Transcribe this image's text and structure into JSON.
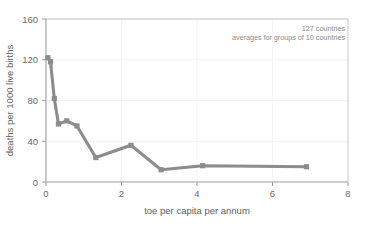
{
  "chart_data": {
    "type": "line",
    "title": "",
    "xlabel": "toe per capita per annum",
    "ylabel": "deaths per 1000 live births",
    "xlim": [
      0,
      8
    ],
    "ylim": [
      0,
      160
    ],
    "xticks": [
      0,
      2,
      4,
      6,
      8
    ],
    "yticks": [
      0,
      40,
      80,
      120,
      160
    ],
    "xtick_labels": [
      "0",
      "2",
      "4",
      "6",
      "8"
    ],
    "ytick_labels": [
      "0",
      "40",
      "80",
      "120",
      "160"
    ],
    "grid": true,
    "legend": "none",
    "series": [
      {
        "name": "infant mortality vs energy use",
        "color": "#8c8c8c",
        "marker": "square",
        "x": [
          0.05,
          0.12,
          0.22,
          0.33,
          0.55,
          0.82,
          1.32,
          2.25,
          3.05,
          4.15,
          6.9
        ],
        "y": [
          122,
          118,
          82,
          57,
          60,
          55,
          24,
          36,
          12,
          16,
          15
        ]
      }
    ],
    "annotations": [
      {
        "text": "127 countries",
        "x": 6.0,
        "y": 151
      },
      {
        "text": "averages for groups of 10 countries",
        "x": 6.0,
        "y": 143
      }
    ]
  },
  "annotation": {
    "line1": "127 countries",
    "line2": "averages for groups of 10 countries"
  },
  "axes": {
    "x_title": "toe per capita per annum",
    "y_title": "deaths per 1000 live births",
    "x_tick_0": "0",
    "x_tick_1": "2",
    "x_tick_2": "4",
    "x_tick_3": "6",
    "x_tick_4": "8",
    "y_tick_0": "0",
    "y_tick_1": "40",
    "y_tick_2": "80",
    "y_tick_3": "120",
    "y_tick_4": "160"
  },
  "colors": {
    "series": "#8c8c8c",
    "axis": "#a8a8a8",
    "grid": "#eaeaea",
    "text": "#6b6b6b",
    "background": "#ffffff"
  }
}
